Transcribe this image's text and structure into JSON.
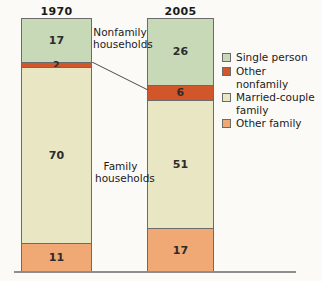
{
  "chart_data": {
    "type": "bar",
    "subtype": "stacked-bar-100pct",
    "title": "",
    "xlabel": "",
    "ylabel": "",
    "ylim": [
      0,
      100
    ],
    "grid": false,
    "legend_position": "right",
    "categories": [
      "1970",
      "2005"
    ],
    "series": [
      {
        "name": "Single person",
        "values": [
          17,
          26
        ],
        "color": "#c7d9b7"
      },
      {
        "name": "Other nonfamily",
        "values": [
          2,
          6
        ],
        "color": "#d1562a"
      },
      {
        "name": "Married-couple family",
        "values": [
          70,
          51
        ],
        "color": "#e8e6c3"
      },
      {
        "name": "Other family",
        "values": [
          11,
          17
        ],
        "color": "#f0a875"
      }
    ],
    "stack_order_top_to_bottom": [
      "Single person",
      "Other nonfamily",
      "Married-couple family",
      "Other family"
    ],
    "annotations": [
      {
        "text": "Nonfamily\nhouseholds",
        "covers": [
          "Single person",
          "Other nonfamily"
        ]
      },
      {
        "text": "Family\nhouseholds",
        "covers": [
          "Married-couple family",
          "Other family"
        ]
      }
    ]
  },
  "axis": {
    "year_labels": [
      {
        "label": "1970"
      },
      {
        "label": "2005"
      }
    ]
  },
  "bars": [
    {
      "year": "1970",
      "segments": [
        {
          "name": "Single person",
          "value": "17",
          "pct": 17
        },
        {
          "name": "Other nonfamily",
          "value": "2",
          "pct": 2
        },
        {
          "name": "Married-couple family",
          "value": "70",
          "pct": 70
        },
        {
          "name": "Other family",
          "value": "11",
          "pct": 11
        }
      ]
    },
    {
      "year": "2005",
      "segments": [
        {
          "name": "Single person",
          "value": "26",
          "pct": 26
        },
        {
          "name": "Other nonfamily",
          "value": "6",
          "pct": 6
        },
        {
          "name": "Married-couple family",
          "value": "51",
          "pct": 51
        },
        {
          "name": "Other family",
          "value": "17",
          "pct": 17
        }
      ]
    }
  ],
  "annotations": {
    "nonfamily": "Nonfamily\nhouseholds",
    "family": "Family\nhouseholds"
  },
  "legend": {
    "items": [
      {
        "label": "Single person",
        "color": "#c7d9b7"
      },
      {
        "label": "Other nonfamily",
        "color": "#d1562a"
      },
      {
        "label": "Married-couple\nfamily",
        "color": "#e8e6c3"
      },
      {
        "label": "Other family",
        "color": "#f0a875"
      }
    ]
  },
  "colors": {
    "single_person": "#c7d9b7",
    "other_nonfamily": "#d1562a",
    "married_couple_family": "#e8e6c3",
    "other_family": "#f0a875",
    "outline": "#6b6b6b",
    "baseline": "#8d8d8d",
    "background": "#fbfaf7"
  }
}
